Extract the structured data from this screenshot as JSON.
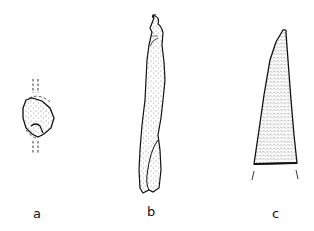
{
  "figure": {
    "type": "archaeological artifact line drawing",
    "panels": [
      {
        "id": "a",
        "label": "a"
      },
      {
        "id": "b",
        "label": "b"
      },
      {
        "id": "c",
        "label": "c"
      }
    ]
  },
  "colors": {
    "ink": "#111111",
    "background": "#ffffff"
  }
}
